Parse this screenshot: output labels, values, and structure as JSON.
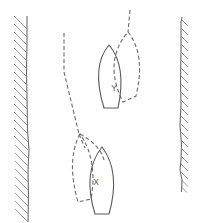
{
  "diagram": {
    "type": "nautical-boat-positions",
    "colors": {
      "line": "#5a5a5a",
      "hatch": "#8a8a8a",
      "background": "#ffffff"
    },
    "banks": [
      {
        "id": "left-bank",
        "hatch_side": "left"
      },
      {
        "id": "right-bank",
        "hatch_side": "right"
      }
    ],
    "boats": [
      {
        "id": "boat-y",
        "label": "Y",
        "style": "solid"
      },
      {
        "id": "boat-y-previous",
        "label": "",
        "style": "dashed"
      },
      {
        "id": "boat-x",
        "label": "X",
        "style": "solid"
      },
      {
        "id": "boat-x-previous",
        "label": "",
        "style": "dashed"
      }
    ],
    "labels": {
      "y": "Y",
      "x": "X"
    }
  }
}
